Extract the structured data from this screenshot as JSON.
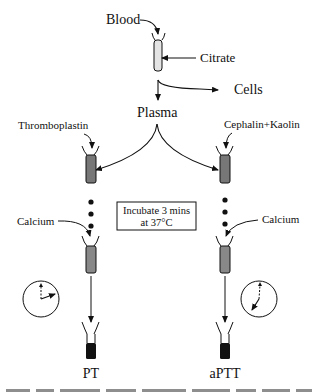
{
  "diagram": {
    "nodes": {
      "blood": "Blood",
      "citrate": "Citrate",
      "cells": "Cells",
      "plasma": "Plasma",
      "thromboplastin": "Thromboplastin",
      "cephalin_kaolin": "Cephalin+Kaolin",
      "incubate_line1": "Incubate 3 mins",
      "incubate_line2": "at 37°C",
      "calcium_left": "Calcium",
      "calcium_right": "Calcium",
      "pt": "PT",
      "aptt": "aPTT"
    },
    "caption_partial": "Fig. ... Overview of ... the coagulation ... (PT) ..."
  }
}
